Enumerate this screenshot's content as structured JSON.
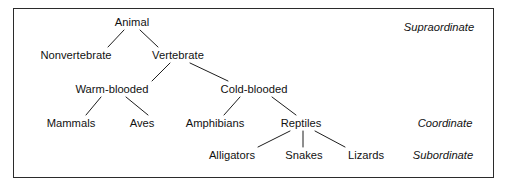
{
  "figure": {
    "type": "hierarchy-tree-diagram",
    "title": "",
    "border_color": "#2b2b2b",
    "text_color": "#111111",
    "background": "#ffffff"
  },
  "nodes": [
    {
      "id": "animal",
      "label": "Animal",
      "x": 132,
      "y": 22,
      "level": "supraordinate"
    },
    {
      "id": "nonvertebrate",
      "label": "Nonvertebrate",
      "x": 76,
      "y": 55,
      "level": ""
    },
    {
      "id": "vertebrate",
      "label": "Vertebrate",
      "x": 178,
      "y": 55,
      "level": ""
    },
    {
      "id": "warmblooded",
      "label": "Warm-blooded",
      "x": 112,
      "y": 89,
      "level": ""
    },
    {
      "id": "coldblooded",
      "label": "Cold-blooded",
      "x": 254,
      "y": 89,
      "level": ""
    },
    {
      "id": "mammals",
      "label": "Mammals",
      "x": 71,
      "y": 123,
      "level": "coordinate"
    },
    {
      "id": "aves",
      "label": "Aves",
      "x": 142,
      "y": 123,
      "level": "coordinate"
    },
    {
      "id": "amphibians",
      "label": "Amphibians",
      "x": 215,
      "y": 123,
      "level": "coordinate"
    },
    {
      "id": "reptiles",
      "label": "Reptiles",
      "x": 301,
      "y": 123,
      "level": "coordinate"
    },
    {
      "id": "alligators",
      "label": "Alligators",
      "x": 232,
      "y": 155,
      "level": "subordinate"
    },
    {
      "id": "snakes",
      "label": "Snakes",
      "x": 304,
      "y": 155,
      "level": "subordinate"
    },
    {
      "id": "lizards",
      "label": "Lizards",
      "x": 366,
      "y": 155,
      "level": "subordinate"
    }
  ],
  "edges": [
    {
      "from": "animal",
      "to": "nonvertebrate",
      "x1": 124,
      "y1": 30,
      "x2": 108,
      "y2": 47
    },
    {
      "from": "animal",
      "to": "vertebrate",
      "x1": 140,
      "y1": 30,
      "x2": 158,
      "y2": 47
    },
    {
      "from": "vertebrate",
      "to": "warmblooded",
      "x1": 170,
      "y1": 63,
      "x2": 152,
      "y2": 81
    },
    {
      "from": "vertebrate",
      "to": "coldblooded",
      "x1": 190,
      "y1": 63,
      "x2": 228,
      "y2": 81
    },
    {
      "from": "warmblooded",
      "to": "mammals",
      "x1": 101,
      "y1": 97,
      "x2": 86,
      "y2": 115
    },
    {
      "from": "warmblooded",
      "to": "aves",
      "x1": 126,
      "y1": 97,
      "x2": 148,
      "y2": 115
    },
    {
      "from": "coldblooded",
      "to": "amphibians",
      "x1": 240,
      "y1": 97,
      "x2": 224,
      "y2": 115
    },
    {
      "from": "coldblooded",
      "to": "reptiles",
      "x1": 272,
      "y1": 97,
      "x2": 296,
      "y2": 115
    },
    {
      "from": "reptiles",
      "to": "alligators",
      "x1": 290,
      "y1": 131,
      "x2": 258,
      "y2": 147
    },
    {
      "from": "reptiles",
      "to": "snakes",
      "x1": 303,
      "y1": 131,
      "x2": 303,
      "y2": 147
    },
    {
      "from": "reptiles",
      "to": "lizards",
      "x1": 315,
      "y1": 131,
      "x2": 345,
      "y2": 147
    }
  ],
  "level_labels": [
    {
      "id": "supraordinate",
      "label": "Supraordinate",
      "x": 439,
      "y": 27
    },
    {
      "id": "coordinate",
      "label": "Coordinate",
      "x": 445,
      "y": 123
    },
    {
      "id": "subordinate",
      "label": "Subordinate",
      "x": 443,
      "y": 155
    }
  ]
}
